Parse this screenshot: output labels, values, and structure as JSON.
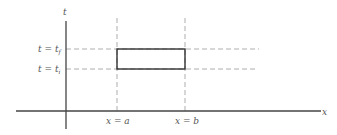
{
  "diagram": {
    "type": "spacetime-region",
    "axes": {
      "horizontal_label": "x",
      "vertical_label": "t"
    },
    "vertical_markers": [
      {
        "label_var": "x",
        "label_eq": " = ",
        "label_val": "a"
      },
      {
        "label_var": "x",
        "label_eq": " = ",
        "label_val": "b"
      }
    ],
    "horizontal_markers": [
      {
        "label_var": "t",
        "label_eq": " = ",
        "label_val": "t",
        "label_sub": "f"
      },
      {
        "label_var": "t",
        "label_eq": " = ",
        "label_val": "t",
        "label_sub": "i"
      }
    ],
    "region": {
      "description": "rectangle bounded by x=a, x=b, t=t_i, t=t_f"
    },
    "colors": {
      "axis": "#333333",
      "dashed": "#888888",
      "rect": "#333333",
      "text": "#555555"
    }
  }
}
